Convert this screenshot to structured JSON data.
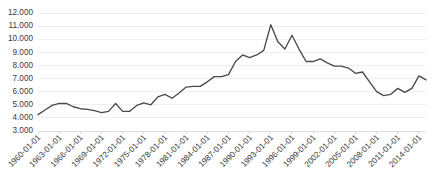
{
  "chart_data": {
    "type": "line",
    "title": "",
    "subtitle": "",
    "xlabel": "",
    "ylabel": "",
    "grid": true,
    "legend": false,
    "legend_position": "none",
    "line_color": "#4a4a4a",
    "background_color": "#ffffff",
    "gridline_color": "#e8e8e8",
    "ylim": [
      3000,
      12000
    ],
    "ytick_step": 1000,
    "ytick_labels": [
      "12.000",
      "11.000",
      "10.000",
      "9.000",
      "8.000",
      "7.000",
      "6.000",
      "5.000",
      "4.000",
      "3.000"
    ],
    "ytick_values": [
      12000,
      11000,
      10000,
      9000,
      8000,
      7000,
      6000,
      5000,
      4000,
      3000
    ],
    "xtick_labels": [
      "1960-01-01",
      "1963-01-01",
      "1966-01-01",
      "1969-01-01",
      "1972-01-01",
      "1975-01-01",
      "1978-01-01",
      "1981-01-01",
      "1984-01-01",
      "1987-01-01",
      "1990-01-01",
      "1993-01-01",
      "1996-01-01",
      "1999-01-01",
      "2002-01-01",
      "2005-01-01",
      "2008-01-01",
      "2011-01-01",
      "2014-01-01"
    ],
    "xtick_label_rotation": -45,
    "x": [
      "1960-01-01",
      "1961-01-01",
      "1962-01-01",
      "1963-01-01",
      "1964-01-01",
      "1965-01-01",
      "1966-01-01",
      "1967-01-01",
      "1968-01-01",
      "1969-01-01",
      "1970-01-01",
      "1971-01-01",
      "1972-01-01",
      "1973-01-01",
      "1974-01-01",
      "1975-01-01",
      "1976-01-01",
      "1977-01-01",
      "1978-01-01",
      "1979-01-01",
      "1980-01-01",
      "1981-01-01",
      "1982-01-01",
      "1983-01-01",
      "1984-01-01",
      "1985-01-01",
      "1986-01-01",
      "1987-01-01",
      "1988-01-01",
      "1989-01-01",
      "1990-01-01",
      "1991-01-01",
      "1992-01-01",
      "1993-01-01",
      "1994-01-01",
      "1995-01-01",
      "1996-01-01",
      "1997-01-01",
      "1998-01-01",
      "1999-01-01",
      "2000-01-01",
      "2001-01-01",
      "2002-01-01",
      "2003-01-01",
      "2004-01-01",
      "2005-01-01",
      "2006-01-01",
      "2007-01-01",
      "2008-01-01",
      "2009-01-01",
      "2010-01-01",
      "2011-01-01",
      "2012-01-01",
      "2013-01-01",
      "2014-01-01",
      "2015-01-01"
    ],
    "values": [
      4250,
      4600,
      4950,
      5100,
      5100,
      4850,
      4700,
      4650,
      4550,
      4400,
      4500,
      5100,
      4500,
      4500,
      4950,
      5150,
      5000,
      5600,
      5800,
      5500,
      5900,
      6350,
      6400,
      6400,
      6750,
      7150,
      7150,
      7300,
      8300,
      8800,
      8600,
      8800,
      9150,
      11100,
      9800,
      9250,
      10300,
      9250,
      8300,
      8300,
      8500,
      8200,
      7950,
      7950,
      7800,
      7400,
      7500,
      6750,
      6000,
      5700,
      5800,
      6250,
      5950,
      6250,
      7200,
      6900
    ],
    "series_name": "Series 1",
    "n_points": 56,
    "ymin_observed": 4250,
    "ymax_observed": 11100
  }
}
